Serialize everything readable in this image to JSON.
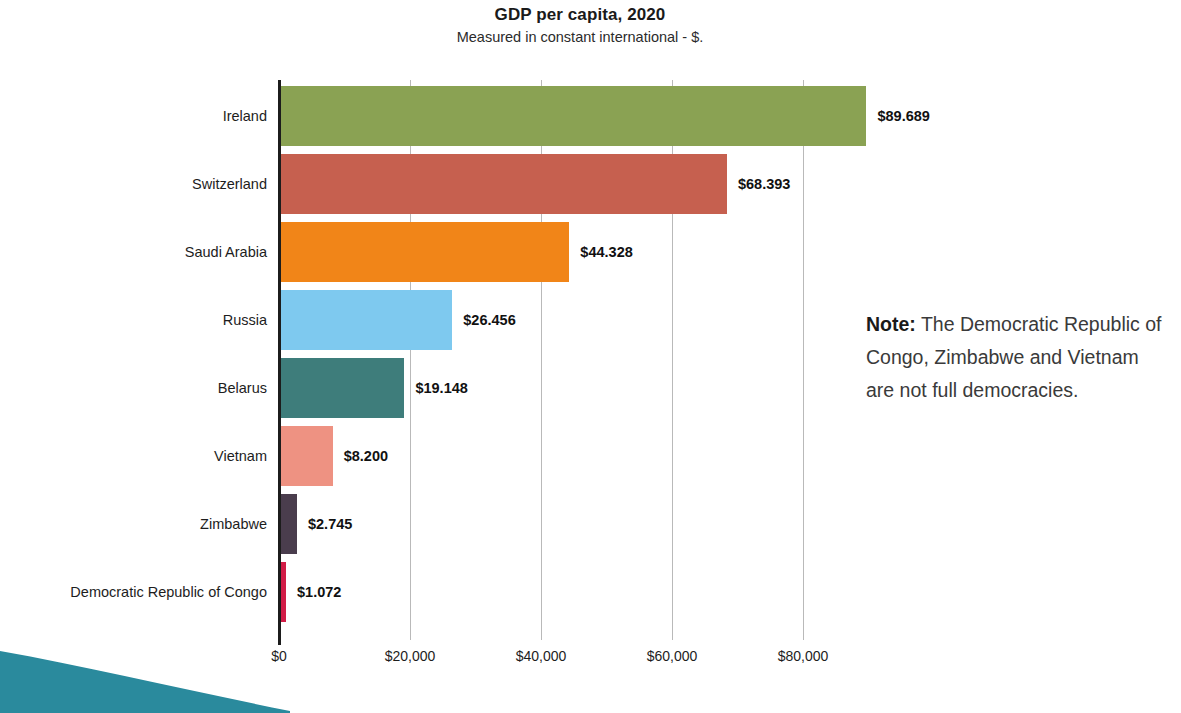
{
  "chart_data": {
    "type": "bar",
    "orientation": "horizontal",
    "title": "GDP per capita, 2020",
    "subtitle": "Measured in constant international - $.",
    "xlabel": "",
    "ylabel": "",
    "xlim": [
      0,
      92000
    ],
    "grid": true,
    "legend": "none",
    "categories": [
      "Ireland",
      "Switzerland",
      "Saudi Arabia",
      "Russia",
      "Belarus",
      "Vietnam",
      "Zimbabwe",
      "Democratic Republic of Congo"
    ],
    "values": [
      89689,
      68393,
      44328,
      26456,
      19148,
      8200,
      2745,
      1072
    ],
    "value_labels": [
      "$89.689",
      "$68.393",
      "$44.328",
      "$26.456",
      "$19.148",
      "$8.200",
      "$2.745",
      "$1.072"
    ],
    "bar_colors": [
      "#8aa253",
      "#c6604f",
      "#f18518",
      "#7ec9ef",
      "#3e7d7b",
      "#ee9282",
      "#4a3d4d",
      "#d11c46"
    ],
    "xticks": [
      0,
      20000,
      40000,
      60000,
      80000
    ],
    "xtick_labels": [
      "$0",
      "$20,000",
      "$40,000",
      "$60,000",
      "$80,000"
    ]
  },
  "note": {
    "label": "Note:",
    "text": " The Democratic Republic of Congo, Zimbabwe and Vietnam are not full democracies."
  },
  "decor": {
    "wave_color": "#2a8a9d"
  }
}
